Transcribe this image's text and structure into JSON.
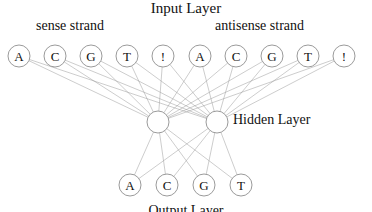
{
  "figure": {
    "kind": "neural-network-diagram",
    "width": 372,
    "height": 212,
    "background_color": "#ffffff",
    "node_fill_color": "#ffffff",
    "node_stroke_color": "#8f8f8f",
    "edge_color": "#9b9b9b",
    "text_color": "#111111"
  },
  "captions": {
    "input_layer": "Input Layer",
    "sense_strand": "sense strand",
    "antisense_strand": "antisense strand",
    "hidden_layer": "Hidden Layer",
    "output_layer": "Output Layer"
  },
  "layers": {
    "input": {
      "name": "Input Layer",
      "count": 10,
      "radius": 11,
      "y": 56,
      "nodes": [
        {
          "label": "A",
          "x": 19,
          "group": "sense strand"
        },
        {
          "label": "C",
          "x": 55,
          "group": "sense strand"
        },
        {
          "label": "G",
          "x": 91,
          "group": "sense strand"
        },
        {
          "label": "T",
          "x": 127,
          "group": "sense strand"
        },
        {
          "label": "!",
          "x": 163,
          "group": "sense strand"
        },
        {
          "label": "A",
          "x": 200,
          "group": "antisense strand"
        },
        {
          "label": "C",
          "x": 236,
          "group": "antisense strand"
        },
        {
          "label": "G",
          "x": 272,
          "group": "antisense strand"
        },
        {
          "label": "T",
          "x": 308,
          "group": "antisense strand"
        },
        {
          "label": "!",
          "x": 344,
          "group": "antisense strand"
        }
      ]
    },
    "hidden": {
      "name": "Hidden Layer",
      "count": 2,
      "radius": 11,
      "y": 122,
      "nodes": [
        {
          "label": "",
          "x": 158
        },
        {
          "label": "",
          "x": 217
        }
      ]
    },
    "output": {
      "name": "Output Layer",
      "count": 4,
      "radius": 11,
      "y": 185,
      "nodes": [
        {
          "label": "A",
          "x": 130
        },
        {
          "label": "C",
          "x": 167
        },
        {
          "label": "G",
          "x": 204
        },
        {
          "label": "T",
          "x": 241
        }
      ]
    }
  },
  "connections": {
    "input_to_hidden": "fully-connected",
    "hidden_to_output": "fully-connected",
    "input_to_hidden_count": 20,
    "hidden_to_output_count": 8
  }
}
